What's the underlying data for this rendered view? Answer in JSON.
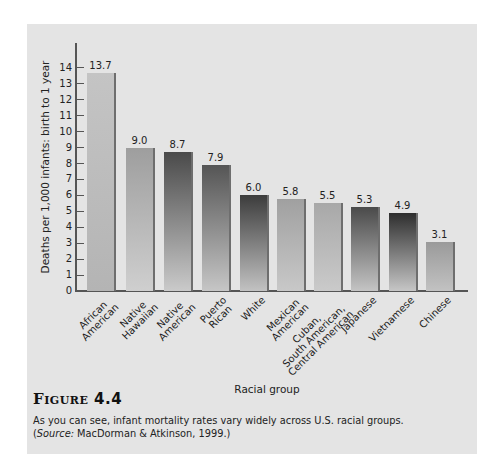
{
  "figure": {
    "label": "Figure",
    "number": "4.4",
    "caption_line1": "As you can see, infant mortality rates vary widely across U.S. racial groups.",
    "caption_source_prefix": "(",
    "caption_source_label": "Source:",
    "caption_source_text": " MacDorman & Atkinson, 1999.)"
  },
  "chart_data": {
    "type": "bar",
    "title": "",
    "xlabel": "Racial group",
    "ylabel": "Deaths per 1,000 infants: birth to 1 year",
    "ylim": [
      0,
      14
    ],
    "yticks": [
      0,
      1,
      2,
      3,
      4,
      5,
      6,
      7,
      8,
      9,
      10,
      11,
      12,
      13,
      14
    ],
    "grid": false,
    "legend": null,
    "categories": [
      "African American",
      "Native Hawaiian",
      "Native American",
      "Puerto Rican",
      "White",
      "Mexican American",
      "Cuban, South American, Central American",
      "Japanese",
      "Vietnamese",
      "Chinese"
    ],
    "category_lines": [
      [
        "African",
        "American"
      ],
      [
        "Native",
        "Hawaiian"
      ],
      [
        "Native",
        "American"
      ],
      [
        "Puerto",
        "Rican"
      ],
      [
        "White"
      ],
      [
        "Mexican",
        "American"
      ],
      [
        "Cuban,",
        "South American,",
        "Central American"
      ],
      [
        "Japanese"
      ],
      [
        "Vietnamese"
      ],
      [
        "Chinese"
      ]
    ],
    "values": [
      13.7,
      9.0,
      8.7,
      7.9,
      6.0,
      5.8,
      5.5,
      5.3,
      4.9,
      3.1
    ],
    "value_labels": [
      "13.7",
      "9.0",
      "8.7",
      "7.9",
      "6.0",
      "5.8",
      "5.5",
      "5.3",
      "4.9",
      "3.1"
    ],
    "bar_colors": [
      [
        "#c4c4c4",
        "#b4b4b4"
      ],
      [
        "#9e9e9e",
        "#cfcfcf"
      ],
      [
        "#4a4a4a",
        "#cacaca"
      ],
      [
        "#555555",
        "#c6c6c6"
      ],
      [
        "#3c3c3c",
        "#c2c2c2"
      ],
      [
        "#a0a0a0",
        "#c8c8c8"
      ],
      [
        "#a8a8a8",
        "#cacaca"
      ],
      [
        "#4a4a4a",
        "#c4c4c4"
      ],
      [
        "#2e2e2e",
        "#c6c6c6"
      ],
      [
        "#9a9a9a",
        "#c2c2c2"
      ]
    ]
  }
}
